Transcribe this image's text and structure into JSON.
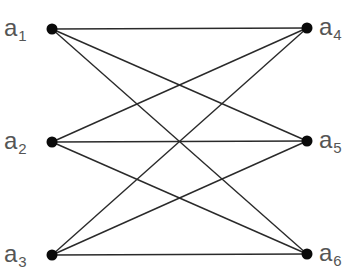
{
  "diagram": {
    "type": "bipartite-graph",
    "nodes": [
      {
        "id": "a1",
        "label": "a",
        "sub": "1",
        "side": "left",
        "x": 52,
        "y": 29
      },
      {
        "id": "a2",
        "label": "a",
        "sub": "2",
        "side": "left",
        "x": 52,
        "y": 142
      },
      {
        "id": "a3",
        "label": "a",
        "sub": "3",
        "side": "left",
        "x": 52,
        "y": 255
      },
      {
        "id": "a4",
        "label": "a",
        "sub": "4",
        "side": "right",
        "x": 307,
        "y": 28
      },
      {
        "id": "a5",
        "label": "a",
        "sub": "5",
        "side": "right",
        "x": 307,
        "y": 141
      },
      {
        "id": "a6",
        "label": "a",
        "sub": "6",
        "side": "right",
        "x": 307,
        "y": 254
      }
    ],
    "edges": [
      [
        "a1",
        "a4"
      ],
      [
        "a1",
        "a5"
      ],
      [
        "a1",
        "a6"
      ],
      [
        "a2",
        "a4"
      ],
      [
        "a2",
        "a5"
      ],
      [
        "a2",
        "a6"
      ],
      [
        "a3",
        "a4"
      ],
      [
        "a3",
        "a5"
      ],
      [
        "a3",
        "a6"
      ]
    ],
    "colors": {
      "edge": "#2a2a2a",
      "node": "#0a0a0a",
      "label": "#555555"
    }
  }
}
